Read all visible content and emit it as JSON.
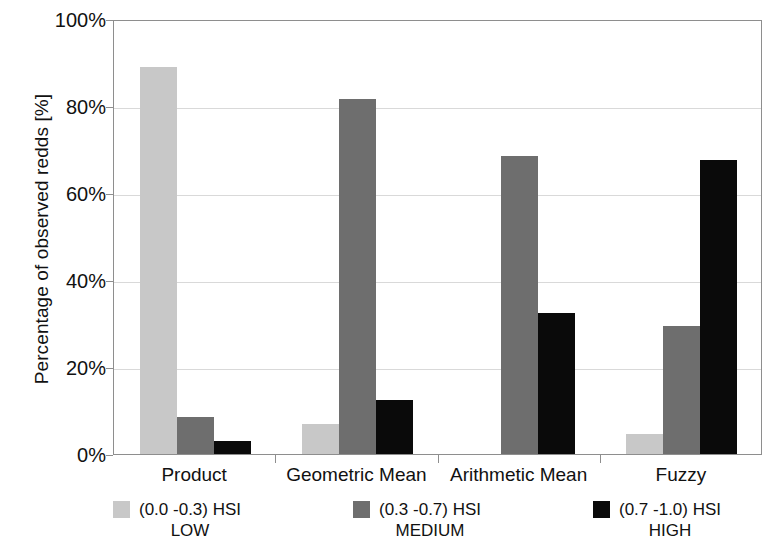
{
  "chart_data": {
    "type": "bar",
    "title": "",
    "subtitle": "",
    "xlabel": "",
    "ylabel": "Percentage of observed redds [%]",
    "categories": [
      "Product",
      "Geometric Mean",
      "Arithmetic Mean",
      "Fuzzy"
    ],
    "series": [
      {
        "name": "(0.0 -0.3) HSI LOW",
        "short": "LOW",
        "range": "(0.0 -0.3) HSI",
        "color": "#c8c8c8",
        "values": [
          89,
          7,
          0,
          4.5
        ]
      },
      {
        "name": "(0.3 -0.7) HSI MEDIUM",
        "short": "MEDIUM",
        "range": "(0.3 -0.7) HSI",
        "color": "#6e6e6e",
        "values": [
          8.5,
          81.5,
          68.5,
          29.5
        ]
      },
      {
        "name": "(0.7 -1.0) HSI HIGH",
        "short": "HIGH",
        "range": "(0.7 -1.0) HSI",
        "color": "#0a0a0a",
        "values": [
          3,
          12.5,
          32.5,
          67.5
        ]
      }
    ],
    "ylim": [
      0,
      100
    ],
    "ytick_values": [
      0,
      20,
      40,
      60,
      80,
      100
    ],
    "ytick_labels": [
      "0%",
      "20%",
      "40%",
      "60%",
      "80%",
      "100%"
    ],
    "grid": true,
    "legend_position": "bottom",
    "annotations": []
  },
  "legend": {
    "entries": [
      {
        "range": "(0.0 -0.3) HSI",
        "level": "LOW"
      },
      {
        "range": "(0.3 -0.7) HSI",
        "level": "MEDIUM"
      },
      {
        "range": "(0.7 -1.0) HSI",
        "level": "HIGH"
      }
    ]
  }
}
